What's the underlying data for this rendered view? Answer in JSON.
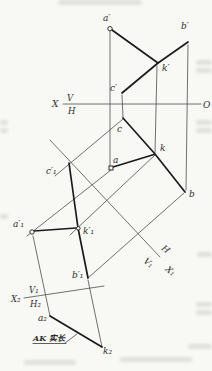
{
  "figure": {
    "colors": {
      "paper": "#f8f8f5",
      "thin_line": "#4d4d4d",
      "thick_line": "#1b1b1b",
      "label": "#2d2d2d"
    },
    "labels": {
      "v_view": {
        "a": "a′",
        "b": "b′",
        "k": "k′",
        "c": "c′"
      },
      "main_axis": {
        "x": "X",
        "v": "V",
        "h": "H",
        "o": "O"
      },
      "h_view": {
        "a": "a",
        "b": "b",
        "k": "k",
        "c": "c"
      },
      "aux1_view": {
        "a": "a′₁",
        "b": "b′₁",
        "k": "k′₁",
        "c": "c′₁"
      },
      "aux1_axis": {
        "h": "H",
        "v1": "V₁",
        "x1": "X₁"
      },
      "aux2_axis": {
        "x2": "X₂",
        "v1": "V₁",
        "h2": "H₂"
      },
      "aux2_view": {
        "a": "a₂",
        "k": "k₂"
      },
      "annotation": {
        "true_length": "AK 实长"
      }
    }
  }
}
